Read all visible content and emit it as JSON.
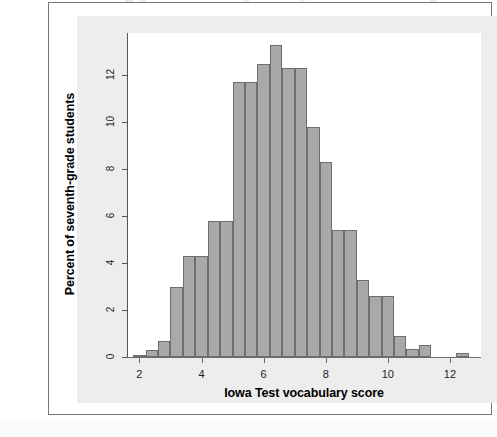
{
  "figure": {
    "background_color": "#ededed",
    "plot_background_color": "#ffffff",
    "frame_border_color": "#767676"
  },
  "chart_data": {
    "type": "bar",
    "chart_subtype": "histogram",
    "title": "",
    "xlabel": "Iowa Test vocabulary score",
    "ylabel": "Percent of seventh-grade students",
    "xlim": [
      1.6,
      13.0
    ],
    "ylim": [
      0,
      13.8
    ],
    "xticks": [
      2,
      4,
      6,
      8,
      10,
      12
    ],
    "xtick_labels": [
      "2",
      "4",
      "6",
      "8",
      "10",
      "12"
    ],
    "yticks": [
      0,
      2,
      4,
      6,
      8,
      10,
      12
    ],
    "ytick_labels": [
      "0",
      "2",
      "4",
      "6",
      "8",
      "10",
      "12"
    ],
    "grid": false,
    "legend": false,
    "bin_width": 0.4,
    "bar_fill_color": "#a9a9a9",
    "bar_edge_color": "#6e6e6e",
    "bin_left_edges": [
      1.8,
      2.2,
      2.6,
      3.0,
      3.4,
      3.8,
      4.2,
      4.6,
      5.0,
      5.4,
      5.8,
      6.2,
      6.6,
      7.0,
      7.4,
      7.8,
      8.2,
      8.6,
      9.0,
      9.4,
      9.8,
      10.2,
      10.6,
      11.0,
      11.4,
      11.8,
      12.2
    ],
    "bin_centers": [
      2.0,
      2.4,
      2.8,
      3.2,
      3.6,
      4.0,
      4.4,
      4.8,
      5.2,
      5.6,
      6.0,
      6.4,
      6.8,
      7.2,
      7.6,
      8.0,
      8.4,
      8.8,
      9.2,
      9.6,
      10.0,
      10.4,
      10.8,
      11.2,
      11.6,
      12.0,
      12.4
    ],
    "values": [
      0.1,
      0.3,
      0.7,
      3.0,
      4.3,
      4.3,
      5.8,
      11.7,
      12.5,
      13.3,
      12.3,
      12.3,
      12.3,
      12.3,
      9.8,
      8.3,
      5.4,
      3.3,
      2.6,
      2.6,
      2.6,
      0.9,
      0.35,
      0.5,
      0.0,
      0.0,
      0.15
    ],
    "bars": [
      {
        "left": 1.8,
        "width": 0.4,
        "height": 0.1
      },
      {
        "left": 2.2,
        "width": 0.4,
        "height": 0.3
      },
      {
        "left": 2.6,
        "width": 0.4,
        "height": 0.7
      },
      {
        "left": 3.0,
        "width": 0.4,
        "height": 3.0
      },
      {
        "left": 3.4,
        "width": 0.4,
        "height": 4.3
      },
      {
        "left": 3.8,
        "width": 0.4,
        "height": 4.3
      },
      {
        "left": 4.2,
        "width": 0.4,
        "height": 5.8
      },
      {
        "left": 4.6,
        "width": 0.4,
        "height": 5.8
      },
      {
        "left": 5.0,
        "width": 0.4,
        "height": 11.7
      },
      {
        "left": 5.4,
        "width": 0.4,
        "height": 11.7
      },
      {
        "left": 5.8,
        "width": 0.4,
        "height": 12.5
      },
      {
        "left": 6.2,
        "width": 0.4,
        "height": 13.3
      },
      {
        "left": 6.6,
        "width": 0.4,
        "height": 12.3
      },
      {
        "left": 7.0,
        "width": 0.4,
        "height": 12.3
      },
      {
        "left": 7.4,
        "width": 0.4,
        "height": 9.8
      },
      {
        "left": 7.8,
        "width": 0.4,
        "height": 8.3
      },
      {
        "left": 8.2,
        "width": 0.4,
        "height": 5.4
      },
      {
        "left": 8.6,
        "width": 0.4,
        "height": 5.4
      },
      {
        "left": 9.0,
        "width": 0.4,
        "height": 3.3
      },
      {
        "left": 9.4,
        "width": 0.4,
        "height": 2.6
      },
      {
        "left": 9.8,
        "width": 0.4,
        "height": 2.6
      },
      {
        "left": 10.2,
        "width": 0.4,
        "height": 0.9
      },
      {
        "left": 10.6,
        "width": 0.4,
        "height": 0.35
      },
      {
        "left": 11.0,
        "width": 0.4,
        "height": 0.5
      },
      {
        "left": 11.4,
        "width": 0.4,
        "height": 0.0
      },
      {
        "left": 11.8,
        "width": 0.4,
        "height": 0.0
      },
      {
        "left": 12.2,
        "width": 0.4,
        "height": 0.15
      }
    ]
  }
}
